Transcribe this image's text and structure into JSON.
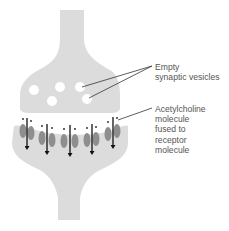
{
  "diagram": {
    "type": "synapse-illustration",
    "colors": {
      "terminal_fill": "#dcdcdc",
      "vesicle_fill": "#ffffff",
      "receptor_fill": "#8e8e8e",
      "arrow_color": "#111111",
      "leader_line": "#333333",
      "label_text": "#555555"
    },
    "labels": {
      "vesicles": {
        "lines": [
          "Empty",
          "synaptic vesicles"
        ]
      },
      "acetylcholine": {
        "lines": [
          "Acetylcholine",
          "molecule",
          "fused to",
          "receptor",
          "molecule"
        ]
      }
    },
    "vesicles": [
      {
        "cx": 34,
        "cy": 90,
        "r": 5
      },
      {
        "cx": 60,
        "cy": 87,
        "r": 5
      },
      {
        "cx": 80,
        "cy": 87,
        "r": 5
      },
      {
        "cx": 52,
        "cy": 101,
        "r": 5
      },
      {
        "cx": 87,
        "cy": 99,
        "r": 5
      }
    ],
    "receptor_pairs": 5,
    "arrows": 5
  }
}
